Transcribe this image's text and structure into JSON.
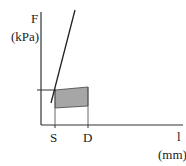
{
  "diagram": {
    "y_axis": {
      "variable": "F",
      "unit": "(kPa)"
    },
    "x_axis": {
      "variable": "l",
      "unit": "(mm)",
      "ticks": [
        "S",
        "D"
      ]
    },
    "colors": {
      "axis": "#333333",
      "line": "#222222",
      "shaded_region": "#a6a6a6"
    },
    "elements": {
      "steep_line": "straight line rising steeply",
      "shaded_region": "quadrilateral between S and D",
      "reference_tick": "horizontal mark on F axis"
    }
  }
}
